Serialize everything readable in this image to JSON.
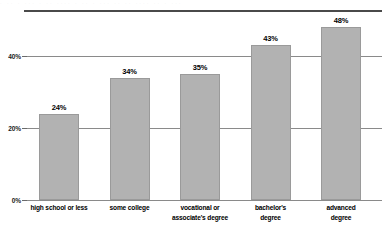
{
  "chart_data": {
    "type": "bar",
    "title": "",
    "subtitle": "",
    "xlabel": "",
    "ylabel": "",
    "categories": [
      "high school or less",
      "some college",
      "vocational or\nassociate's degree",
      "bachelor's\ndegree",
      "advanced\ndegree"
    ],
    "values": [
      24,
      34,
      35,
      43,
      48
    ],
    "value_labels": [
      "24%",
      "34%",
      "35%",
      "43%",
      "48%"
    ],
    "ylim": [
      0,
      52.8
    ],
    "yticks": [
      0,
      20,
      40
    ],
    "ytick_labels": [
      "0%",
      "20%",
      "40%"
    ],
    "grid": true,
    "legend": false,
    "legend_position": "none",
    "series": [
      {
        "name": "",
        "values": [
          24,
          34,
          35,
          43,
          48
        ]
      }
    ],
    "colors": {
      "bar_fill": "#b2b2b2",
      "bar_stroke": "#9a9a9a",
      "gridline": "#8a8a8a",
      "axis": "#4a4a4a",
      "text": "#000000",
      "background": "#ffffff"
    }
  },
  "categories_display": [
    {
      "line1": "high school or less",
      "line2": ""
    },
    {
      "line1": "some college",
      "line2": ""
    },
    {
      "line1": "vocational or",
      "line2": "associate's degree"
    },
    {
      "line1": "bachelor's",
      "line2": "degree"
    },
    {
      "line1": "advanced",
      "line2": "degree"
    }
  ],
  "top_artifact": {
    "text": "· ·· · ··· · ·· ···· · ·· · ··· ·· ·· ···· ·· · ···"
  }
}
